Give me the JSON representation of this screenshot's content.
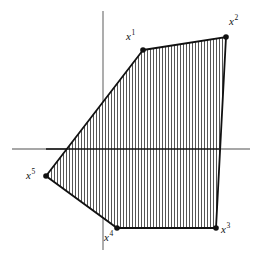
{
  "figure": {
    "background_color": "#ffffff",
    "width": 256,
    "height": 259
  },
  "axes": {
    "line_color": "#8a8a8a",
    "x_axis": {
      "name": "horizontal-axis",
      "x1": 12,
      "y1": 149,
      "x2": 250,
      "y2": 149
    },
    "y_axis": {
      "name": "vertical-axis",
      "x1": 103,
      "y1": 11,
      "x2": 103,
      "y2": 250
    }
  },
  "polygon": {
    "name": "convex-pentagon",
    "stroke_color": "#111111",
    "fill_pattern": "vertical-hatch",
    "hatch_color": "#4d4d4d",
    "hatch_spacing": 3,
    "points": "143,50 226,37 216,228 117,228 46,176",
    "vertices": [
      {
        "id": "x1",
        "label": "x",
        "superscript": "1",
        "x": 143,
        "y": 50,
        "label_x": 126,
        "label_y": 36
      },
      {
        "id": "x2",
        "label": "x",
        "superscript": "2",
        "x": 226,
        "y": 37,
        "label_x": 229,
        "label_y": 21
      },
      {
        "id": "x3",
        "label": "x",
        "superscript": "3",
        "x": 216,
        "y": 228,
        "label_x": 220,
        "label_y": 228
      },
      {
        "id": "x4",
        "label": "x",
        "superscript": "4",
        "x": 117,
        "y": 228,
        "label_x": 104,
        "label_y": 233
      },
      {
        "id": "x5",
        "label": "x",
        "superscript": "5",
        "x": 46,
        "y": 176,
        "label_x": 28,
        "label_y": 172
      }
    ],
    "vertex_dot_radius": 2.8,
    "vertex_dot_color": "#111111"
  },
  "chart_data": {
    "type": "scatter",
    "title": "",
    "xlabel": "",
    "ylabel": "",
    "series": [
      {
        "name": "extreme points",
        "points": [
          {
            "label": "x1",
            "x": 143,
            "y": 50
          },
          {
            "label": "x2",
            "x": 226,
            "y": 37
          },
          {
            "label": "x3",
            "x": 216,
            "y": 228
          },
          {
            "label": "x4",
            "x": 117,
            "y": 228
          },
          {
            "label": "x5",
            "x": 46,
            "y": 176
          }
        ]
      }
    ],
    "annotations": [
      "x1",
      "x2",
      "x3",
      "x4",
      "x5"
    ],
    "grid": false,
    "legend": "none"
  }
}
